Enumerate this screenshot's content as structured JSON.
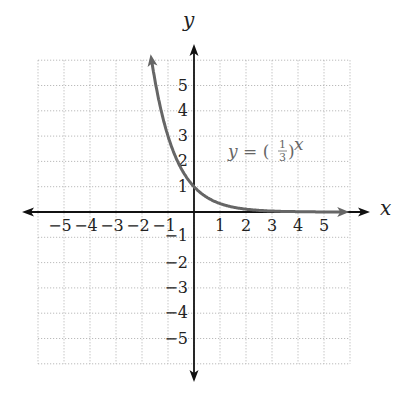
{
  "chart_data": {
    "type": "line",
    "title": "",
    "xlabel": "x",
    "ylabel": "y",
    "xlim": [
      -6,
      6
    ],
    "ylim": [
      -6,
      6
    ],
    "grid": true,
    "grid_style": "dotted",
    "x_ticks": [
      -5,
      -4,
      -3,
      -2,
      -1,
      1,
      2,
      3,
      4,
      5
    ],
    "y_ticks": [
      -5,
      -4,
      -3,
      -2,
      -1,
      1,
      2,
      3,
      4,
      5
    ],
    "x_tick_labels": [
      "−5",
      "−4",
      "−3",
      "−2",
      "−1",
      "1",
      "2",
      "3",
      "4",
      "5"
    ],
    "y_tick_labels": [
      "−5",
      "−4",
      "−3",
      "−2",
      "−1",
      "1",
      "2",
      "3",
      "4",
      "5"
    ],
    "series": [
      {
        "name": "y = (1/3)^x",
        "function": "(1/3)^x",
        "color": "#666666",
        "x": [
          -1.6,
          -1.5,
          -1.25,
          -1,
          -0.75,
          -0.5,
          -0.25,
          0,
          0.5,
          1,
          1.5,
          2,
          2.5,
          3,
          4,
          5,
          5.8
        ],
        "y": [
          5.8,
          5.2,
          3.95,
          3.0,
          2.28,
          1.73,
          1.32,
          1.0,
          0.58,
          0.33,
          0.19,
          0.11,
          0.06,
          0.04,
          0.01,
          0.004,
          0.002
        ],
        "arrows": "both"
      }
    ],
    "annotations": [
      {
        "text": "y = (1/3)^x",
        "x": 1.4,
        "y": 2.4
      }
    ]
  },
  "labels": {
    "x_axis": "x",
    "y_axis": "y",
    "equation_lhs": "y = (",
    "equation_num": "1",
    "equation_den": "3",
    "equation_rparen": ")",
    "equation_exp": "x"
  },
  "colors": {
    "axis": "#111111",
    "curve": "#666666",
    "grid": "#aaaaaa",
    "text": "#222222"
  }
}
